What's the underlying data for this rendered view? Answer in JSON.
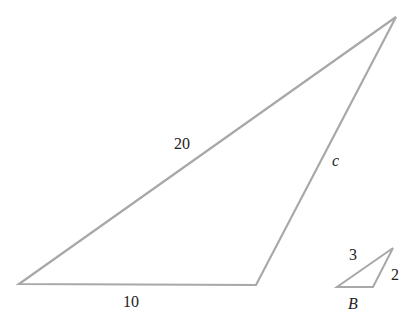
{
  "diagram": {
    "stroke_color": "#a8a8a8",
    "label_color": "#222222",
    "large_triangle": {
      "vertices": [
        [
          19,
          284
        ],
        [
          256,
          285
        ],
        [
          396,
          17
        ]
      ],
      "labels": {
        "hypotenuse": "20",
        "base": "10",
        "right_side": "c"
      }
    },
    "small_triangle": {
      "vertices": [
        [
          337,
          287
        ],
        [
          373,
          287
        ],
        [
          393,
          248
        ]
      ],
      "labels": {
        "top": "3",
        "right": "2",
        "angle": "B"
      }
    }
  }
}
